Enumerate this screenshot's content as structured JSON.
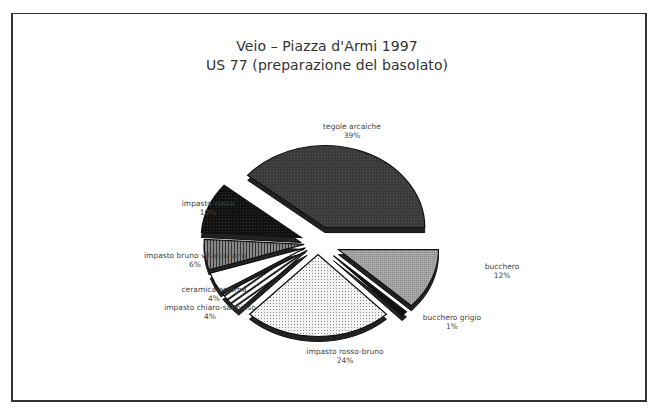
{
  "chart": {
    "title_line1": "Veio – Piazza d'Armi 1997",
    "title_line2": "US 77 (preparazione del basolato)"
  },
  "labels": [
    {
      "name": "tegole arcaiche",
      "pct": "39%"
    },
    {
      "name": "bucchero",
      "pct": "12%"
    },
    {
      "name": "bucchero grigio",
      "pct": "1%"
    },
    {
      "name": "impasto rosso-bruno",
      "pct": "24%"
    },
    {
      "name": "impasto chiaro-sabbioso",
      "pct": "4%"
    },
    {
      "name": "ceramica acroma",
      "pct": "4%"
    },
    {
      "name": "impasto bruno villanoviano",
      "pct": "6%"
    },
    {
      "name": "impasto rosso",
      "pct": "10%"
    }
  ],
  "chart_data": {
    "type": "pie",
    "categories": [
      "tegole arcaiche",
      "bucchero",
      "bucchero grigio",
      "impasto rosso-bruno",
      "impasto chiaro-sabbioso",
      "ceramica acroma",
      "impasto bruno villanoviano",
      "impasto rosso"
    ],
    "values": [
      39,
      12,
      1,
      24,
      4,
      4,
      6,
      10
    ],
    "unit": "%",
    "exploded": true,
    "style": "3D tilted pie with pattern fills",
    "legend": "none (direct labels)"
  }
}
